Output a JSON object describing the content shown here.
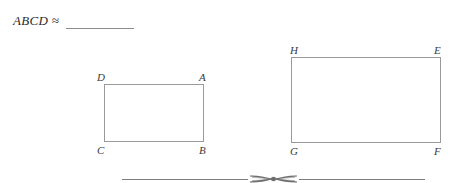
{
  "page": {
    "background_color": "#ffffff",
    "line_color": "#9a9a9a",
    "text_color": "#2c2c2c"
  },
  "prompt": {
    "text": "ABCD ≈",
    "blank_label": "answer-blank"
  },
  "figures": [
    {
      "name": "rectangle-abcd",
      "shape": "rectangle",
      "vertices": [
        {
          "label": "D",
          "position": "top-left"
        },
        {
          "label": "A",
          "position": "top-right"
        },
        {
          "label": "C",
          "position": "bottom-left"
        },
        {
          "label": "B",
          "position": "bottom-right"
        }
      ]
    },
    {
      "name": "rectangle-efgh",
      "shape": "rectangle",
      "vertices": [
        {
          "label": "H",
          "position": "top-left"
        },
        {
          "label": "E",
          "position": "top-right"
        },
        {
          "label": "G",
          "position": "bottom-left"
        },
        {
          "label": "F",
          "position": "bottom-right"
        }
      ]
    }
  ],
  "divider": {
    "ornament": "scissors-icon",
    "color": "#7d7d7d"
  }
}
